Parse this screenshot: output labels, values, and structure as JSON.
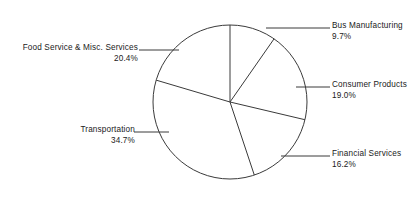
{
  "chart_data": {
    "type": "pie",
    "title": "",
    "subtitle": "",
    "xlabel": "",
    "ylabel": "",
    "legend_position": "none",
    "grid": false,
    "start_angle_deg": 0,
    "direction": "clockwise",
    "categories": [
      "Bus Manufacturing",
      "Consumer Products",
      "Financial Services",
      "Transportation",
      "Food Service & Misc. Services"
    ],
    "values": [
      9.7,
      19.0,
      16.2,
      34.7,
      20.4
    ],
    "value_unit": "%",
    "slices": [
      {
        "label": "Bus Manufacturing",
        "value": 9.7,
        "value_text": "9.7%",
        "color": "#ffffff",
        "stroke": "#3a3a3a",
        "start_deg": 0.0,
        "end_deg": 34.9,
        "leader_side": "right"
      },
      {
        "label": "Consumer Products",
        "value": 19.0,
        "value_text": "19.0%",
        "color": "#ffffff",
        "stroke": "#3a3a3a",
        "start_deg": 34.9,
        "end_deg": 103.3,
        "leader_side": "right"
      },
      {
        "label": "Financial Services",
        "value": 16.2,
        "value_text": "16.2%",
        "color": "#ffffff",
        "stroke": "#3a3a3a",
        "start_deg": 103.3,
        "end_deg": 161.6,
        "leader_side": "right"
      },
      {
        "label": "Transportation",
        "value": 34.7,
        "value_text": "34.7%",
        "color": "#ffffff",
        "stroke": "#3a3a3a",
        "start_deg": 161.6,
        "end_deg": 286.5,
        "leader_side": "left"
      },
      {
        "label": "Food Service & Misc. Services",
        "value": 20.4,
        "value_text": "20.4%",
        "color": "#ffffff",
        "stroke": "#3a3a3a",
        "start_deg": 286.5,
        "end_deg": 360.0,
        "leader_side": "left"
      }
    ],
    "total": 100.0,
    "colors": {
      "background": "#ffffff",
      "outline": "#3a3a3a",
      "text": "#1a1a1a",
      "leader_line": "#3a3a3a"
    }
  }
}
